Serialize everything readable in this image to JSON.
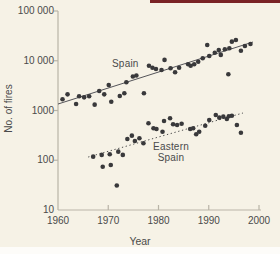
{
  "page": {
    "background": "#f6f2e6",
    "accent_bar_color": "#7a2325",
    "bottom_strip_color": "#fdfcf9",
    "text_color": "#4a4a4a",
    "axis_color": "#b9b4a7"
  },
  "chart_data": {
    "type": "scatter",
    "title": "",
    "xlabel": "Year",
    "ylabel": "No. of fires",
    "grid": false,
    "legend_position": "inline-labels",
    "x_axis": {
      "min": 1960,
      "max": 2000,
      "ticks": [
        1960,
        1970,
        1980,
        1990,
        2000
      ],
      "tick_labels": [
        "1960",
        "1970",
        "1980",
        "1990",
        "2000"
      ]
    },
    "y_axis": {
      "scale": "log",
      "min": 10,
      "max": 100000,
      "ticks": [
        10,
        100,
        1000,
        10000,
        100000
      ],
      "tick_labels": [
        "10",
        "100",
        "1000",
        "10 000",
        "100 000"
      ]
    },
    "marker": {
      "shape": "circle",
      "color": "#39393b",
      "radius": 2.3
    },
    "series": [
      {
        "name": "Spain",
        "label": "Spain",
        "trend_line": {
          "style": "solid",
          "x": [
            1960,
            1998.8
          ],
          "y": [
            1350,
            23800
          ],
          "color": "#55555a"
        },
        "points": [
          [
            1960.9,
            1680
          ],
          [
            1961.9,
            2110
          ],
          [
            1963.6,
            1350
          ],
          [
            1964.2,
            1930
          ],
          [
            1965.2,
            1840
          ],
          [
            1966.2,
            1930
          ],
          [
            1967.3,
            1310
          ],
          [
            1968.2,
            2470
          ],
          [
            1969.2,
            2110
          ],
          [
            1970.1,
            3260
          ],
          [
            1970.6,
            1500
          ],
          [
            1972.3,
            1950
          ],
          [
            1973.2,
            2220
          ],
          [
            1973.6,
            3690
          ],
          [
            1974.9,
            4830
          ],
          [
            1975.6,
            5050
          ],
          [
            1977.1,
            2220
          ],
          [
            1978.1,
            7950
          ],
          [
            1978.8,
            7240
          ],
          [
            1979.5,
            6830
          ],
          [
            1980.6,
            6520
          ],
          [
            1981.2,
            10400
          ],
          [
            1982.4,
            7050
          ],
          [
            1983.3,
            5860
          ],
          [
            1984.1,
            7240
          ],
          [
            1985.9,
            8490
          ],
          [
            1986.4,
            7950
          ],
          [
            1987.1,
            8490
          ],
          [
            1987.9,
            9560
          ],
          [
            1988.8,
            11200
          ],
          [
            1989.7,
            20800
          ],
          [
            1990.1,
            12500
          ],
          [
            1991.2,
            14500
          ],
          [
            1992.0,
            16400
          ],
          [
            1992.4,
            13100
          ],
          [
            1993.2,
            17000
          ],
          [
            1993.9,
            5350
          ],
          [
            1994.1,
            17800
          ],
          [
            1994.6,
            24200
          ],
          [
            1995.4,
            26100
          ],
          [
            1996.4,
            15900
          ],
          [
            1997.2,
            19800
          ],
          [
            1998.3,
            21700
          ]
        ]
      },
      {
        "name": "Eastern Spain",
        "label_lines": [
          "Eastern",
          "Spain"
        ],
        "trend_line": {
          "style": "dotted",
          "x": [
            1966,
            1996.8
          ],
          "y": [
            116,
            890
          ],
          "color": "#4a4a4a"
        },
        "points": [
          [
            1967.0,
            118
          ],
          [
            1968.7,
            128
          ],
          [
            1968.9,
            74
          ],
          [
            1970.3,
            132
          ],
          [
            1970.5,
            80
          ],
          [
            1971.7,
            31
          ],
          [
            1972.0,
            149
          ],
          [
            1972.9,
            128
          ],
          [
            1973.8,
            267
          ],
          [
            1974.7,
            312
          ],
          [
            1975.3,
            244
          ],
          [
            1976.2,
            276
          ],
          [
            1977.0,
            219
          ],
          [
            1978.0,
            553
          ],
          [
            1979.0,
            439
          ],
          [
            1979.6,
            425
          ],
          [
            1980.8,
            375
          ],
          [
            1981.1,
            615
          ],
          [
            1982.3,
            697
          ],
          [
            1982.9,
            528
          ],
          [
            1983.7,
            512
          ],
          [
            1984.6,
            541
          ],
          [
            1986.3,
            425
          ],
          [
            1986.9,
            439
          ],
          [
            1987.5,
            333
          ],
          [
            1988.1,
            375
          ],
          [
            1989.3,
            495
          ],
          [
            1990.1,
            645
          ],
          [
            1991.4,
            813
          ],
          [
            1992.1,
            718
          ],
          [
            1992.9,
            752
          ],
          [
            1993.6,
            676
          ],
          [
            1994.0,
            766
          ],
          [
            1994.6,
            787
          ],
          [
            1995.6,
            512
          ],
          [
            1996.4,
            358
          ]
        ]
      }
    ]
  }
}
